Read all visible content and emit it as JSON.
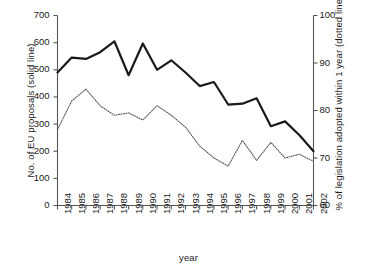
{
  "chart_data": {
    "type": "line",
    "title": "",
    "xlabel": "year",
    "ylabel_left": "No. of EU proposals (solid line)",
    "ylabel_right": "% of legislation adopted within 1 year (dotted line)",
    "categories": [
      "1984",
      "1985",
      "1986",
      "1987",
      "1988",
      "1989",
      "1990",
      "1991",
      "1992",
      "1993",
      "1994",
      "1995",
      "1996",
      "1997",
      "1998",
      "1999",
      "2000",
      "2001",
      "2002"
    ],
    "left_axis": {
      "label": "No. of EU proposals (solid line)",
      "ticks": [
        0,
        100,
        200,
        300,
        400,
        500,
        600,
        700
      ],
      "ylim": [
        0,
        700
      ]
    },
    "right_axis": {
      "label": "% of legislation adopted within 1 year (dotted line)",
      "ticks": [
        60,
        70,
        80,
        90,
        100
      ],
      "ylim": [
        60,
        100
      ]
    },
    "grid": false,
    "legend": "none",
    "series": [
      {
        "name": "No. of EU proposals",
        "style": "solid",
        "axis": "left",
        "color": "#1a1a1a",
        "values": [
          490,
          545,
          540,
          565,
          605,
          480,
          597,
          500,
          535,
          490,
          440,
          455,
          372,
          375,
          395,
          292,
          310,
          260,
          200
        ]
      },
      {
        "name": "% of legislation adopted within 1 year",
        "style": "dotted",
        "axis": "right",
        "color": "#555555",
        "values": [
          76.0,
          82.0,
          84.5,
          81.0,
          79.0,
          79.5,
          78.0,
          81.0,
          79.0,
          76.5,
          72.5,
          70.0,
          68.3,
          73.7,
          69.5,
          73.3,
          70.0,
          70.8,
          69.3
        ]
      }
    ]
  }
}
